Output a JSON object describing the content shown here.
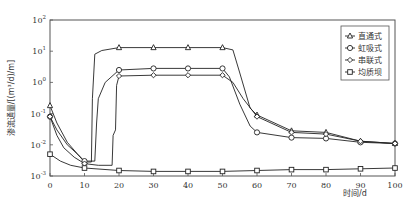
{
  "chart_data": {
    "type": "line",
    "title": "",
    "xlabel": "时间/d",
    "ylabel": "渗流通量/[(m³/d)/m]",
    "xlim": [
      0,
      100
    ],
    "ylim": [
      0.001,
      100
    ],
    "yscale": "log",
    "x_ticks": [
      0,
      10,
      20,
      30,
      40,
      50,
      60,
      70,
      80,
      90,
      100
    ],
    "y_ticks": [
      {
        "value": 0.001,
        "base": "10",
        "exp": "-3"
      },
      {
        "value": 0.01,
        "base": "10",
        "exp": "-2"
      },
      {
        "value": 0.1,
        "base": "10",
        "exp": "-1"
      },
      {
        "value": 1,
        "base": "10",
        "exp": "0"
      },
      {
        "value": 10,
        "base": "10",
        "exp": "1"
      },
      {
        "value": 100,
        "base": "10",
        "exp": "2"
      }
    ],
    "grid": false,
    "legend_position": "upper right",
    "series": [
      {
        "name": "直通式",
        "marker": "triangle",
        "x": [
          0,
          10,
          20,
          30,
          40,
          50,
          60,
          70,
          80,
          90,
          100
        ],
        "values": [
          0.18,
          0.0028,
          13,
          13,
          13,
          13,
          0.09,
          0.028,
          0.025,
          0.013,
          0.011
        ],
        "path": [
          [
            0,
            0.18
          ],
          [
            2,
            0.05
          ],
          [
            5,
            0.012
          ],
          [
            8,
            0.005
          ],
          [
            10,
            0.0028
          ],
          [
            12,
            0.0028
          ],
          [
            12.3,
            0.3
          ],
          [
            13,
            8
          ],
          [
            15,
            10.5
          ],
          [
            20,
            13
          ],
          [
            30,
            13
          ],
          [
            40,
            13
          ],
          [
            50,
            13
          ],
          [
            53,
            11
          ],
          [
            55,
            2
          ],
          [
            58,
            0.15
          ],
          [
            60,
            0.09
          ],
          [
            70,
            0.028
          ],
          [
            80,
            0.025
          ],
          [
            90,
            0.013
          ],
          [
            100,
            0.011
          ]
        ]
      },
      {
        "name": "虹吸式",
        "marker": "circle",
        "x": [
          0,
          10,
          20,
          30,
          40,
          50,
          60,
          70,
          80,
          90,
          100
        ],
        "values": [
          0.08,
          0.003,
          2.5,
          2.8,
          2.8,
          2.8,
          0.025,
          0.017,
          0.016,
          0.012,
          0.011
        ],
        "path": [
          [
            0,
            0.08
          ],
          [
            2,
            0.03
          ],
          [
            5,
            0.01
          ],
          [
            8,
            0.005
          ],
          [
            10,
            0.003
          ],
          [
            13,
            0.003
          ],
          [
            13.5,
            0.05
          ],
          [
            14,
            0.3
          ],
          [
            16,
            1.0
          ],
          [
            20,
            2.5
          ],
          [
            30,
            2.8
          ],
          [
            40,
            2.8
          ],
          [
            50,
            2.8
          ],
          [
            52,
            1.5
          ],
          [
            55,
            0.2
          ],
          [
            58,
            0.04
          ],
          [
            60,
            0.025
          ],
          [
            70,
            0.017
          ],
          [
            80,
            0.016
          ],
          [
            90,
            0.012
          ],
          [
            100,
            0.011
          ]
        ]
      },
      {
        "name": "串联式",
        "marker": "diamond",
        "x": [
          0,
          10,
          20,
          30,
          40,
          50,
          60,
          70,
          80,
          90,
          100
        ],
        "values": [
          0.08,
          0.0025,
          1.6,
          1.7,
          1.7,
          1.7,
          0.08,
          0.025,
          0.022,
          0.013,
          0.011
        ],
        "path": [
          [
            0,
            0.08
          ],
          [
            2,
            0.02
          ],
          [
            4,
            0.008
          ],
          [
            7,
            0.004
          ],
          [
            10,
            0.0025
          ],
          [
            14,
            0.0022
          ],
          [
            18,
            0.0022
          ],
          [
            18.3,
            0.02
          ],
          [
            19,
            0.03
          ],
          [
            19.3,
            0.8
          ],
          [
            20,
            1.6
          ],
          [
            30,
            1.7
          ],
          [
            40,
            1.7
          ],
          [
            50,
            1.7
          ],
          [
            53,
            1.0
          ],
          [
            56,
            0.3
          ],
          [
            60,
            0.08
          ],
          [
            70,
            0.025
          ],
          [
            80,
            0.022
          ],
          [
            90,
            0.013
          ],
          [
            100,
            0.011
          ]
        ]
      },
      {
        "name": "均质坝",
        "marker": "square",
        "x": [
          0,
          10,
          20,
          30,
          40,
          50,
          60,
          70,
          80,
          90,
          100
        ],
        "values": [
          0.005,
          0.0018,
          0.0015,
          0.0014,
          0.0014,
          0.0014,
          0.0015,
          0.0016,
          0.0016,
          0.0017,
          0.0018
        ],
        "path": [
          [
            0,
            0.005
          ],
          [
            3,
            0.003
          ],
          [
            6,
            0.0022
          ],
          [
            10,
            0.0018
          ],
          [
            20,
            0.0015
          ],
          [
            30,
            0.0014
          ],
          [
            40,
            0.0014
          ],
          [
            50,
            0.0014
          ],
          [
            60,
            0.0015
          ],
          [
            70,
            0.0016
          ],
          [
            80,
            0.0016
          ],
          [
            90,
            0.0017
          ],
          [
            100,
            0.0018
          ]
        ]
      }
    ]
  }
}
